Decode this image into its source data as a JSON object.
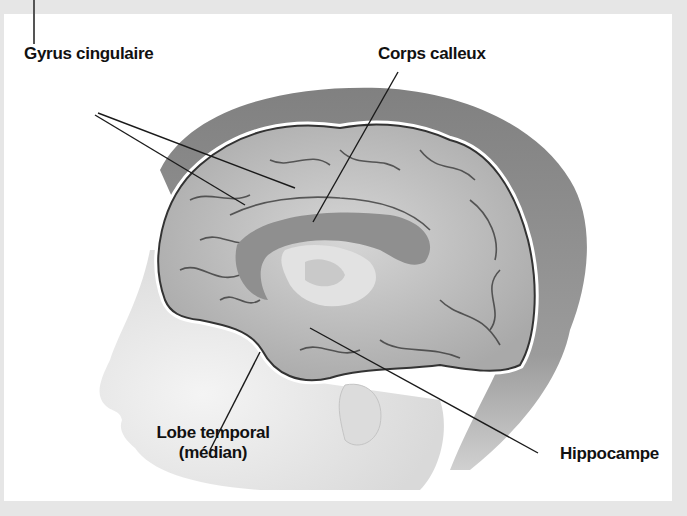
{
  "diagram": {
    "type": "anatomical-illustration",
    "colors": {
      "background": "#ffffff",
      "frame": "#e6e6e6",
      "label_text": "#111111",
      "leader_line": "#1a1a1a",
      "brain_fill": "#bdbdbd",
      "corpus_callosum": "#8f8f8f",
      "thalamus": "#e2e2e2"
    },
    "labels": [
      {
        "id": "gyrus",
        "text": "Gyrus cingulaire"
      },
      {
        "id": "corps",
        "text": "Corps calleux"
      },
      {
        "id": "lobe_line1",
        "text": "Lobe temporal"
      },
      {
        "id": "lobe_line2",
        "text": "(médian)"
      },
      {
        "id": "hippo",
        "text": "Hippocampe"
      }
    ]
  }
}
